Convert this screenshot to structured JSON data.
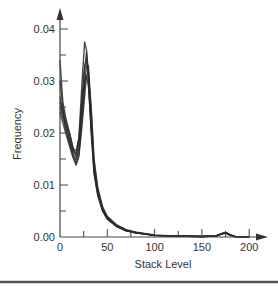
{
  "chart_data": {
    "type": "line",
    "title": "",
    "xlabel": "Stack Level",
    "ylabel": "Frequency",
    "xlim": [
      0,
      210
    ],
    "ylim": [
      0,
      0.042
    ],
    "xticks": [
      0,
      50,
      100,
      150,
      200
    ],
    "yticks": [
      0.0,
      0.01,
      0.02,
      0.03,
      0.04
    ],
    "xtick_labels": [
      "0",
      "50",
      "100",
      "150",
      "200"
    ],
    "ytick_labels": [
      "0.00",
      "0.01",
      "0.02",
      "0.03",
      "0.04"
    ],
    "grid": false,
    "legend": null,
    "x": [
      0,
      3,
      6,
      10,
      14,
      17,
      20,
      23,
      26,
      28,
      30,
      33,
      36,
      40,
      45,
      50,
      60,
      70,
      80,
      100,
      120,
      150,
      165,
      170,
      175,
      180,
      185,
      200
    ],
    "series": [
      {
        "name": "run1",
        "values": [
          0.034,
          0.026,
          0.023,
          0.02,
          0.017,
          0.0155,
          0.019,
          0.029,
          0.0375,
          0.036,
          0.03,
          0.02,
          0.012,
          0.008,
          0.005,
          0.0035,
          0.002,
          0.0012,
          0.0008,
          0.0003,
          0.0002,
          0.0001,
          0.0002,
          0.0006,
          0.0009,
          0.0004,
          0.0001,
          0.0
        ]
      },
      {
        "name": "run2",
        "values": [
          0.03,
          0.025,
          0.022,
          0.019,
          0.016,
          0.0148,
          0.017,
          0.025,
          0.032,
          0.0355,
          0.032,
          0.022,
          0.013,
          0.0085,
          0.0052,
          0.0037,
          0.0021,
          0.0013,
          0.0008,
          0.0003,
          0.0002,
          0.0001,
          0.0002,
          0.0005,
          0.0008,
          0.0004,
          0.0001,
          0.0
        ]
      },
      {
        "name": "run3",
        "values": [
          0.027,
          0.024,
          0.021,
          0.018,
          0.0155,
          0.0142,
          0.016,
          0.022,
          0.029,
          0.033,
          0.033,
          0.024,
          0.014,
          0.009,
          0.0055,
          0.0038,
          0.0022,
          0.0013,
          0.0009,
          0.0003,
          0.0002,
          0.0001,
          0.0002,
          0.0005,
          0.0008,
          0.0003,
          0.0001,
          0.0
        ]
      },
      {
        "name": "run4",
        "values": [
          0.025,
          0.023,
          0.021,
          0.0185,
          0.0165,
          0.016,
          0.018,
          0.024,
          0.03,
          0.031,
          0.029,
          0.021,
          0.013,
          0.0088,
          0.0054,
          0.0036,
          0.0021,
          0.0012,
          0.0008,
          0.0003,
          0.0002,
          0.0001,
          0.0002,
          0.0006,
          0.0009,
          0.0004,
          0.0001,
          0.0
        ]
      },
      {
        "name": "run5",
        "values": [
          0.024,
          0.022,
          0.02,
          0.0175,
          0.0152,
          0.0138,
          0.0155,
          0.021,
          0.027,
          0.031,
          0.0315,
          0.025,
          0.015,
          0.0095,
          0.0058,
          0.004,
          0.0023,
          0.0014,
          0.0009,
          0.0004,
          0.0002,
          0.0001,
          0.0002,
          0.0005,
          0.0007,
          0.0003,
          0.0001,
          0.0
        ]
      },
      {
        "name": "run6",
        "values": [
          0.026,
          0.024,
          0.022,
          0.02,
          0.017,
          0.0165,
          0.019,
          0.026,
          0.033,
          0.034,
          0.031,
          0.021,
          0.0125,
          0.008,
          0.005,
          0.0034,
          0.002,
          0.0012,
          0.0008,
          0.0003,
          0.0002,
          0.0001,
          0.0002,
          0.0006,
          0.0009,
          0.0004,
          0.0001,
          0.0
        ]
      }
    ],
    "annotations": []
  },
  "axes": {
    "x_title": "Stack Level",
    "y_title": "Frequency"
  }
}
